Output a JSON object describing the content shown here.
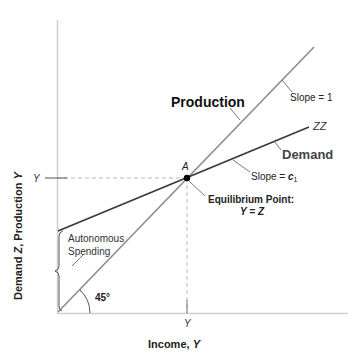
{
  "diagram": {
    "type": "keynesian-cross",
    "y_axis_label_prefix": "Demand ",
    "y_axis_label_z": "Z",
    "y_axis_label_mid": ", Production ",
    "y_axis_label_y": "Y",
    "x_axis_label_prefix": "Income, ",
    "x_axis_label_y": "Y",
    "y_tick_label": "Y",
    "x_tick_label": "Y",
    "production_label": "Production",
    "demand_label": "Demand",
    "zz_label": "ZZ",
    "slope_production": "Slope = 1",
    "slope_demand_prefix": "Slope = ",
    "slope_demand_c": "c",
    "slope_demand_sub": "1",
    "point_label": "A",
    "equilibrium_line1": "Equilibrium Point:",
    "equilibrium_line2": "Y = Z",
    "autonomous_line1": "Autonomous",
    "autonomous_line2": "Spending",
    "angle_label": "45°",
    "colors": {
      "axis": "#c8c8c8",
      "production_line": "#8c8c8c",
      "demand_line": "#3a3a3a",
      "dashed_guide": "#b4b4b4",
      "text": "#111111",
      "demand_text": "#444444"
    }
  }
}
